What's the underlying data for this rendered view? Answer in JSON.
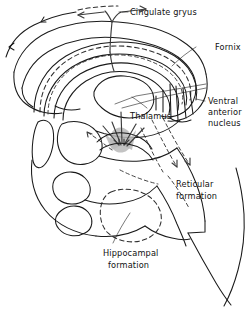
{
  "figure": {
    "background_color": "#ffffff",
    "line_color": "#1a1a1a",
    "shade_color": "#b9b9b9",
    "width": 249,
    "height": 309
  },
  "labels": {
    "cingulate_gyrus": "Cingulate gryus",
    "fornix": "Fornix",
    "ventral_anterior_nucleus_line1": "Ventral",
    "ventral_anterior_nucleus_line2": "anterior",
    "ventral_anterior_nucleus_line3": "nucleus",
    "thalamus": "Thalamus",
    "reticular_formation_line1": "Reticular",
    "reticular_formation_line2": "formation",
    "hippocampal_formation_line1": "Hippocampal",
    "hippocampal_formation_line2": "formation"
  },
  "structures": [
    {
      "name": "cingulate-gyrus",
      "style": "solid-outline"
    },
    {
      "name": "fornix",
      "style": "dashed-arc"
    },
    {
      "name": "thalamus",
      "style": "solid-oval"
    },
    {
      "name": "ventral-anterior-nucleus",
      "style": "solid-outline"
    },
    {
      "name": "reticular-formation",
      "style": "dashed-arrows"
    },
    {
      "name": "hippocampal-formation",
      "style": "dashed-oval"
    },
    {
      "name": "brainstem",
      "style": "solid-outline"
    },
    {
      "name": "midbrain-junction-shading",
      "style": "gray-shade"
    }
  ]
}
